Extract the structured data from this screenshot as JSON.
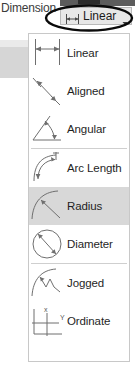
{
  "ribbon": {
    "group_label": "Dimension"
  },
  "split_button": {
    "label": "Linear",
    "icon": "linear-dimension-icon",
    "arrow_icon": "chevron-down-icon",
    "state": "open"
  },
  "annotation": {
    "shape": "ellipse-highlight",
    "color": "#000000",
    "target": "Linear"
  },
  "colors": {
    "panel_background": "#ffffff",
    "panel_border": "#c8c8c8",
    "selected_row": "#d8d8d8",
    "text": "#1f1f1f",
    "icon_stroke": "#6f6f6f",
    "toolbar_strip": "#5c5c5c",
    "ghost_block": "#d6d6d6"
  },
  "dropdown": {
    "items": [
      {
        "label": "Linear",
        "icon": "linear-dimension-icon",
        "selected": false,
        "separator_before": false
      },
      {
        "label": "Aligned",
        "icon": "aligned-dimension-icon",
        "selected": false,
        "separator_before": false
      },
      {
        "label": "Angular",
        "icon": "angular-dimension-icon",
        "selected": false,
        "separator_before": false
      },
      {
        "label": "Arc Length",
        "icon": "arc-length-dimension-icon",
        "selected": false,
        "separator_before": true
      },
      {
        "label": "Radius",
        "icon": "radius-dimension-icon",
        "selected": true,
        "separator_before": false
      },
      {
        "label": "Diameter",
        "icon": "diameter-dimension-icon",
        "selected": false,
        "separator_before": false
      },
      {
        "label": "Jogged",
        "icon": "jogged-dimension-icon",
        "selected": false,
        "separator_before": true
      },
      {
        "label": "Ordinate",
        "icon": "ordinate-dimension-icon",
        "selected": false,
        "separator_before": false
      }
    ]
  },
  "icon_labels": {
    "ordinate_x": "x",
    "ordinate_y": "Y"
  }
}
